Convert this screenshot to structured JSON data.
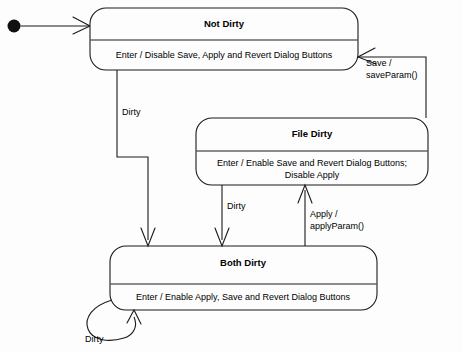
{
  "diagram": {
    "type": "uml-state-diagram",
    "background_color": "#fdfdfd",
    "line_color": "#1a1a1a"
  },
  "initial": {
    "name": "initial-state-marker"
  },
  "states": [
    {
      "id": "not-dirty",
      "name": "Not Dirty",
      "action": "Enter / Disable Save, Apply and Revert Dialog Buttons"
    },
    {
      "id": "file-dirty",
      "name": "File Dirty",
      "action_line1": "Enter / Enable Save and Revert Dialog Buttons;",
      "action_line2": "Disable Apply"
    },
    {
      "id": "both-dirty",
      "name": "Both Dirty",
      "action": "Enter / Enable Apply, Save and Revert Dialog Buttons"
    }
  ],
  "transitions": [
    {
      "id": "init-to-not-dirty",
      "label": "",
      "from": "initial",
      "to": "not-dirty"
    },
    {
      "id": "not-dirty-to-both-dirty",
      "label": "Dirty",
      "from": "not-dirty",
      "to": "both-dirty"
    },
    {
      "id": "file-dirty-to-both-dirty",
      "label": "Dirty",
      "from": "file-dirty",
      "to": "both-dirty"
    },
    {
      "id": "both-dirty-to-file-dirty",
      "label_line1": "Apply /",
      "label_line2": "applyParam()",
      "from": "both-dirty",
      "to": "file-dirty"
    },
    {
      "id": "file-dirty-to-not-dirty",
      "label_line1": "Save /",
      "label_line2": "saveParam()",
      "from": "file-dirty",
      "to": "not-dirty"
    },
    {
      "id": "both-dirty-self-loop",
      "label": "Dirty",
      "from": "both-dirty",
      "to": "both-dirty"
    }
  ]
}
